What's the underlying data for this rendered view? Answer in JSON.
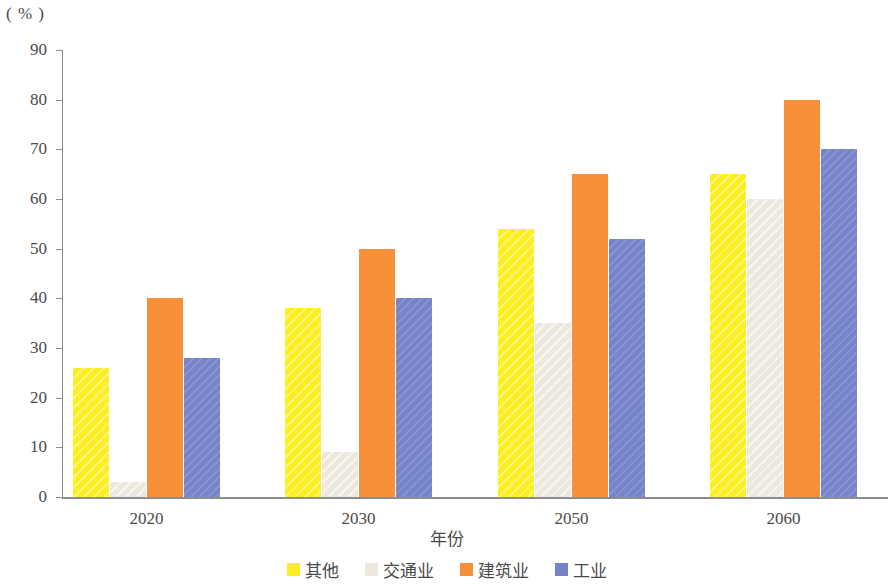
{
  "unit_label": "( % )",
  "x_axis_title": "年份",
  "legend": [
    {
      "label": "其他",
      "color": "#fdee21",
      "key": "other"
    },
    {
      "label": "交通业",
      "color": "#ece8de",
      "key": "transport"
    },
    {
      "label": "建筑业",
      "color": "#f79039",
      "key": "construction"
    },
    {
      "label": "工业",
      "color": "#7583c8",
      "key": "industry"
    }
  ],
  "y_ticks": [
    "90",
    "80",
    "70",
    "60",
    "50",
    "40",
    "30",
    "20",
    "10",
    "0"
  ],
  "chart_data": {
    "type": "bar",
    "title": "",
    "subtitle": "",
    "xlabel": "年份",
    "ylabel": "( % )",
    "ylim": [
      0,
      90
    ],
    "ytick_step": 10,
    "grid": false,
    "legend_position": "bottom",
    "categories": [
      "2020",
      "2030",
      "2050",
      "2060"
    ],
    "series": [
      {
        "name": "其他",
        "color": "#fdee21",
        "values": [
          26,
          38,
          54,
          65
        ]
      },
      {
        "name": "交通业",
        "color": "#ece8de",
        "values": [
          3,
          9,
          35,
          60
        ]
      },
      {
        "name": "建筑业",
        "color": "#f79039",
        "values": [
          40,
          50,
          65,
          80
        ]
      },
      {
        "name": "工业",
        "color": "#7583c8",
        "values": [
          28,
          40,
          52,
          70
        ]
      }
    ]
  }
}
